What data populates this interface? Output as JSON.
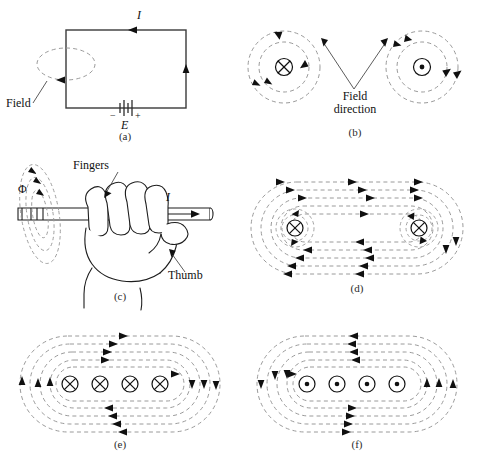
{
  "figure": {
    "title_panels": [
      "(a)",
      "(b)",
      "(c)",
      "(d)",
      "(e)",
      "(f)"
    ],
    "colors": {
      "field_line": "#9a9a9a",
      "wire": "#3a3a3a",
      "arrow": "#101010",
      "ink": "#111111",
      "background": "#ffffff"
    }
  },
  "panel_a": {
    "label": "(a)",
    "current_label": "I",
    "field_label": "Field",
    "emf_label": "E",
    "battery_minus": "−",
    "battery_plus": "+"
  },
  "panel_b": {
    "label": "(b)",
    "field_direction_line1": "Field",
    "field_direction_line2": "direction",
    "left_symbol": "current-into-page",
    "right_symbol": "current-out-of-page",
    "left_symbol_glyph": "⊕",
    "right_symbol_glyph": "⊙",
    "rings_per_symbol": 2
  },
  "panel_c": {
    "label": "(c)",
    "flux_label": "Φ",
    "fingers_label": "Fingers",
    "thumb_label": "Thumb",
    "current_label": "I"
  },
  "panel_d": {
    "label": "(d)",
    "symbols": [
      "⊕",
      "⊕"
    ],
    "symbol_kind": "current-into-page",
    "symbol_count": 2,
    "loop_count": 5
  },
  "panel_e": {
    "label": "(e)",
    "symbols": [
      "⊕",
      "⊕",
      "⊕",
      "⊕"
    ],
    "symbol_kind": "current-into-page",
    "symbol_count": 4,
    "loop_count": 5
  },
  "panel_f": {
    "label": "(f)",
    "symbols": [
      "⊙",
      "⊙",
      "⊙",
      "⊙"
    ],
    "symbol_kind": "current-out-of-page",
    "symbol_count": 4,
    "loop_count": 5
  }
}
